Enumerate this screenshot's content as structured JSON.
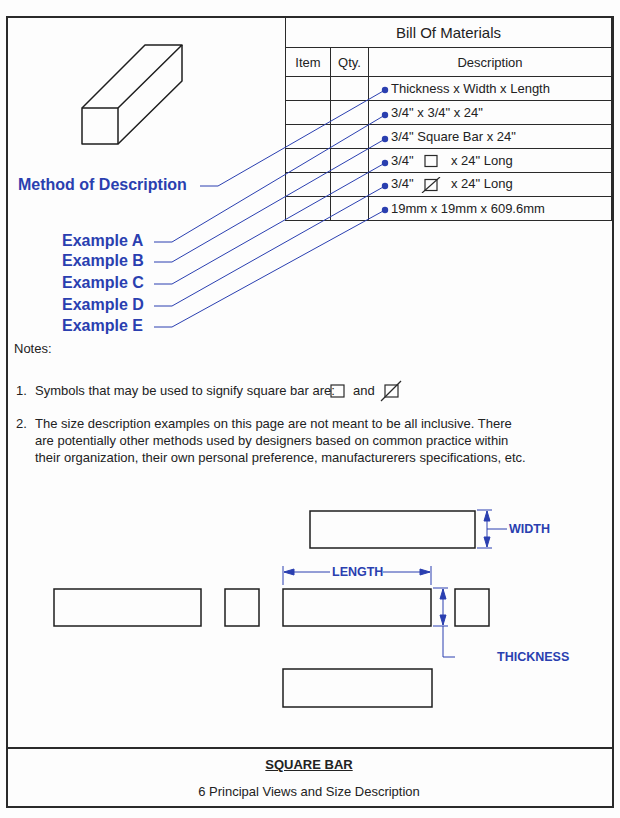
{
  "bom": {
    "title": "Bill Of Materials",
    "headers": [
      "Item",
      "Qty.",
      "Description"
    ],
    "rows": [
      {
        "item": "",
        "qty": "",
        "desc_pre": "Thickness x Width x Length",
        "symbol": "",
        "desc_post": ""
      },
      {
        "item": "",
        "qty": "",
        "desc_pre": "3/4\" x 3/4\" x 24\"",
        "symbol": "",
        "desc_post": ""
      },
      {
        "item": "",
        "qty": "",
        "desc_pre": "3/4\" Square Bar x 24\"",
        "symbol": "",
        "desc_post": ""
      },
      {
        "item": "",
        "qty": "",
        "desc_pre": "3/4\"",
        "symbol": "square",
        "desc_post": "x 24\" Long"
      },
      {
        "item": "",
        "qty": "",
        "desc_pre": "3/4\"",
        "symbol": "square-slash",
        "desc_post": "x 24\" Long"
      },
      {
        "item": "",
        "qty": "",
        "desc_pre": "19mm x 19mm x 609.6mm",
        "symbol": "",
        "desc_post": ""
      }
    ]
  },
  "labels": {
    "method": "Method of Description",
    "examples": [
      "Example A",
      "Example B",
      "Example C",
      "Example D",
      "Example E"
    ]
  },
  "notes": {
    "heading": "Notes:",
    "note1_num": "1.",
    "note1_text": "Symbols that may be used to signify square bar are:",
    "note1_and": "and",
    "note2_num": "2.",
    "note2_lines": [
      "The size description examples on this page are not meant to be all inclusive.  There",
      "are potentially other methods used by designers based on common practice within",
      "their organization, their own personal preference, manufacturerers specifications, etc."
    ]
  },
  "dimensions": {
    "width": "WIDTH",
    "length": "LENGTH",
    "thickness": "THICKNESS"
  },
  "title_block": {
    "title": "SQUARE BAR",
    "subtitle": "6 Principal Views and Size Description"
  },
  "colors": {
    "accent_blue": "#2a3fb0",
    "line": "#2a2a2a"
  }
}
